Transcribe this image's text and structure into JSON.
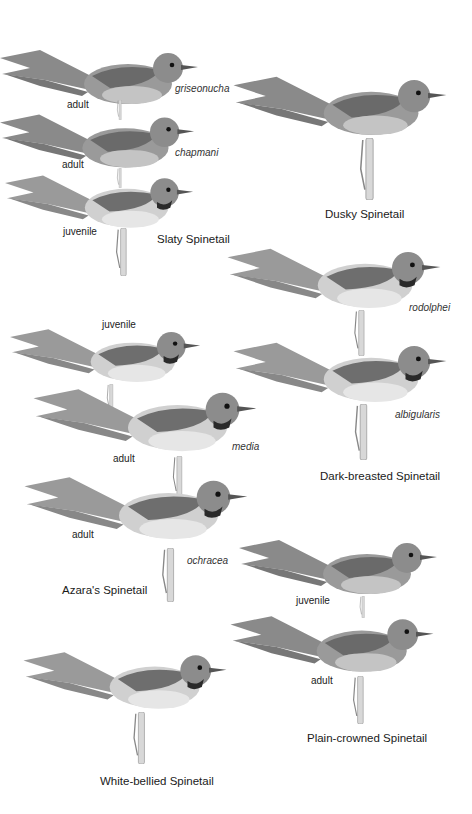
{
  "plate": {
    "species": [
      {
        "name": "Slaty Spinetail",
        "figures": [
          {
            "age": "adult",
            "subspecies": "griseonucha"
          },
          {
            "age": "adult",
            "subspecies": "chapmani"
          },
          {
            "age": "juvenile",
            "subspecies": ""
          }
        ]
      },
      {
        "name": "Dusky Spinetail",
        "figures": [
          {
            "age": "",
            "subspecies": ""
          }
        ]
      },
      {
        "name": "Dark-breasted Spinetail",
        "figures": [
          {
            "age": "",
            "subspecies": "rodolphei"
          },
          {
            "age": "",
            "subspecies": "albigularis"
          }
        ]
      },
      {
        "name": "Azara's Spinetail",
        "figures": [
          {
            "age": "juvenile",
            "subspecies": ""
          },
          {
            "age": "adult",
            "subspecies": "media"
          },
          {
            "age": "adult",
            "subspecies": "ochracea"
          }
        ]
      },
      {
        "name": "Plain-crowned Spinetail",
        "figures": [
          {
            "age": "juvenile",
            "subspecies": ""
          },
          {
            "age": "adult",
            "subspecies": ""
          }
        ]
      },
      {
        "name": "White-bellied Spinetail",
        "figures": [
          {
            "age": "",
            "subspecies": ""
          }
        ]
      }
    ]
  },
  "colors": {
    "background": "#ffffff",
    "bird_dark": "#5a5a5a",
    "bird_mid": "#8a8a8a",
    "bird_light": "#c8c8c8",
    "bird_pale": "#e2e2e2",
    "perch": "#d8d8d8"
  }
}
